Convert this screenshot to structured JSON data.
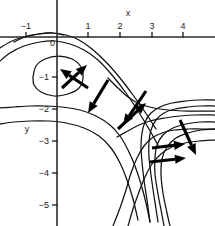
{
  "figure": {
    "type": "contour-vector-field",
    "background": "#ffffff",
    "ink": "#111111",
    "width": 215,
    "height": 226
  },
  "axes": {
    "x_label": "x",
    "y_label": "y",
    "x_ticks": [
      {
        "value": -1,
        "label": "−1",
        "px": 26
      },
      {
        "value": 0,
        "label": "0",
        "px": 57
      },
      {
        "value": 1,
        "label": "1",
        "px": 88
      },
      {
        "value": 2,
        "label": "2",
        "px": 120
      },
      {
        "value": 3,
        "label": "3",
        "px": 152
      },
      {
        "value": 4,
        "label": "4",
        "px": 183
      }
    ],
    "y_ticks": [
      {
        "value": 0,
        "label": "0",
        "py": 44
      },
      {
        "value": -1,
        "label": "−1",
        "py": 77
      },
      {
        "value": -2,
        "label": "−2",
        "py": 109
      },
      {
        "value": -3,
        "label": "−3",
        "py": 141
      },
      {
        "value": -4,
        "label": "−4",
        "py": 173
      },
      {
        "value": -5,
        "label": "−5",
        "py": 205
      }
    ],
    "origin_px": {
      "x": 57,
      "y": 37
    },
    "unit_px": 31.8,
    "x_range": [
      -1.8,
      4.9
    ],
    "y_range": [
      -5.9,
      0.35
    ]
  },
  "chart_data": {
    "type": "line",
    "title": "",
    "xlabel": "x",
    "ylabel": "y",
    "xlim": [
      -1.8,
      4.9
    ],
    "ylim": [
      -5.9,
      0.35
    ],
    "grid": false,
    "legend": "none",
    "series": [
      {
        "name": "closed-oval-contour",
        "closed": true,
        "points_px": "33,77 36,66 45,59 58,56 72,59 81,67 83,78 79,88 68,94 54,96 41,92 34,85 33,77"
      },
      {
        "name": "upper-arc-1",
        "points_px": "0,48 10,42 23,37 38,34 52,33 66,35 79,40 92,49 106,62 120,78 133,95 145,112 156,129"
      },
      {
        "name": "upper-arc-2",
        "points_px": "0,61 10,53 24,46 40,42 55,41 70,44 84,50 98,60 112,75 126,93 138,111 149,129 158,145"
      },
      {
        "name": "upper-arc-3-short",
        "points_px": "14,42 25,37 40,34 53,33 64,35"
      },
      {
        "name": "separatrix-left-branch",
        "points_px": "0,108 14,107 30,106 46,106 62,107 80,110 96,116 110,125 120,136 128,150 135,166 141,184 146,203 150,222"
      },
      {
        "name": "separatrix-lower-left",
        "points_px": "0,124 14,122 30,121 48,121 66,123 84,128 99,136 111,148 120,163 127,180 133,199 138,220"
      },
      {
        "name": "saddle-branch-upper-right",
        "points_px": "108,78 118,88 128,97 140,104 154,108 168,110 183,111 198,111 215,111"
      },
      {
        "name": "saddle-branch-lower-right",
        "points_px": "117,137 126,132 137,126 150,121 165,118 180,116 196,115 215,115"
      },
      {
        "name": "right-fan-1",
        "points_px": "215,100 200,100 186,101 172,103 160,107 151,113 145,122 142,133 141,146 142,162 144,180 147,200 150,222"
      },
      {
        "name": "right-fan-2",
        "points_px": "215,106 201,106 188,107 175,109 164,113 156,120 151,130 149,142 149,157 151,175 154,196 158,222"
      },
      {
        "name": "right-fan-3",
        "points_px": "215,122 200,122 186,124 173,128 163,135 157,145 155,158 155,174 158,194 162,215 164,226"
      },
      {
        "name": "right-fan-4",
        "points_px": "215,129 201,130 188,133 176,138 167,147 162,159 161,174 163,193 167,213 170,226"
      },
      {
        "name": "lower-left-sweep-1",
        "points_px": "113,226 120,208 126,190 131,173 137,158 144,146 152,138 162,133 174,130 188,129 202,129 215,129"
      },
      {
        "name": "lower-left-sweep-2",
        "points_px": "128,226 133,209 139,192 145,177 152,164 161,154 172,147 185,143 199,141 215,140"
      }
    ],
    "vectors": [
      {
        "name": "arrow-up-right-at-oval",
        "tail_px": [
          62,
          88
        ],
        "tip_px": [
          87,
          65
        ]
      },
      {
        "name": "arrow-down-left-at-oval",
        "tail_px": [
          88,
          88
        ],
        "tip_px": [
          60,
          69
        ]
      },
      {
        "name": "arrow-down-right-mid",
        "tail_px": [
          108,
          80
        ],
        "tip_px": [
          88,
          113
        ]
      },
      {
        "name": "arrow-up-right-saddle",
        "tail_px": [
          118,
          129
        ],
        "tip_px": [
          146,
          103
        ]
      },
      {
        "name": "arrow-down-left-saddle",
        "tail_px": [
          146,
          91
        ],
        "tip_px": [
          123,
          125
        ]
      },
      {
        "name": "arrow-right-upper",
        "tail_px": [
          152,
          148
        ],
        "tip_px": [
          185,
          144
        ]
      },
      {
        "name": "arrow-right-lower",
        "tail_px": [
          150,
          162
        ],
        "tip_px": [
          186,
          158
        ]
      },
      {
        "name": "arrow-down-right-far",
        "tail_px": [
          180,
          120
        ],
        "tip_px": [
          196,
          155
        ]
      }
    ]
  }
}
